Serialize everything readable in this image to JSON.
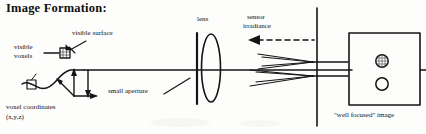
{
  "slide": {
    "title": "Image Formation:",
    "width": 426,
    "height": 134,
    "background_color": "#fdfdfc",
    "ink_color": "#101010"
  },
  "labels": {
    "visible": "visible",
    "voxels": "voxels",
    "visible_surface": "visible surface",
    "voxel_coordinates": "voxel coordinates",
    "xyz": "(x,y,z)",
    "small_aperture": "small aperture",
    "lens": "lens",
    "sensor": "sensor",
    "irradiance": "irradiance",
    "well_focused_image": "\"well focused\" image"
  },
  "diagram": {
    "type": "optical-ray-diagram",
    "optical_axis_y": 70,
    "elements": [
      {
        "name": "voxel-marker",
        "shape": "hatched-square",
        "x": 62,
        "y": 50,
        "size": 9
      },
      {
        "name": "scene-outline",
        "shape": "freehand-surface-curve"
      },
      {
        "name": "open-square-marker",
        "shape": "square-outline",
        "x": 28,
        "y": 85,
        "size": 9
      },
      {
        "name": "coordinate-axes",
        "shape": "three-arrow-axes",
        "x": 78,
        "y": 80
      },
      {
        "name": "aperture-plane",
        "shape": "vertical-line",
        "x": 197,
        "y_top": 32,
        "y_bottom": 104
      },
      {
        "name": "lens",
        "shape": "ellipse",
        "cx": 210,
        "cy": 68,
        "rx": 9,
        "ry": 34
      },
      {
        "name": "sensor-irradiance-arrow",
        "shape": "dashed-arrow-left",
        "x_start": 312,
        "x_end": 252,
        "y": 40
      },
      {
        "name": "ray-cone-upper",
        "shape": "converging-rays",
        "y": 62
      },
      {
        "name": "ray-cone-lower",
        "shape": "converging-rays",
        "y": 78
      },
      {
        "name": "panel-divider",
        "shape": "vertical-line",
        "x": 317,
        "y_top": 8,
        "y_bottom": 126
      },
      {
        "name": "sensor-frame",
        "shape": "rectangle",
        "x": 348,
        "y": 33,
        "w": 72,
        "h": 72
      },
      {
        "name": "focused-spot-hatched",
        "shape": "hatched-circle",
        "cx": 382,
        "cy": 62,
        "r": 6
      },
      {
        "name": "focused-spot-open",
        "shape": "circle-outline",
        "cx": 382,
        "cy": 84,
        "r": 6
      }
    ]
  }
}
